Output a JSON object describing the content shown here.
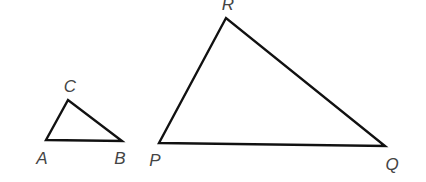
{
  "diagram": {
    "type": "similar-triangles",
    "colors": {
      "stroke": "#111111",
      "label": "#444444",
      "background": "#ffffff"
    },
    "triangles": [
      {
        "name": "ABC",
        "vertices": [
          {
            "label": "A",
            "x": 46,
            "y": 140,
            "lx": 42,
            "ly": 164
          },
          {
            "label": "B",
            "x": 122,
            "y": 141,
            "lx": 120,
            "ly": 164
          },
          {
            "label": "C",
            "x": 68,
            "y": 100,
            "lx": 70,
            "ly": 92
          }
        ]
      },
      {
        "name": "PQR",
        "vertices": [
          {
            "label": "P",
            "x": 159,
            "y": 143,
            "lx": 155,
            "ly": 166
          },
          {
            "label": "Q",
            "x": 385,
            "y": 146,
            "lx": 392,
            "ly": 170
          },
          {
            "label": "R",
            "x": 226,
            "y": 18,
            "lx": 228,
            "ly": 10
          }
        ]
      }
    ]
  }
}
